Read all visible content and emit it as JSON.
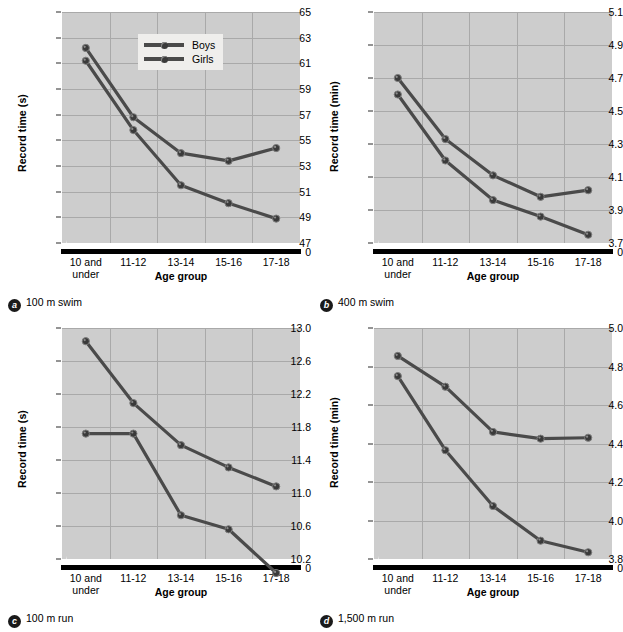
{
  "figure": {
    "legend": {
      "series": [
        "Boys",
        "Girls"
      ]
    },
    "xlabel": "Age group",
    "categories": [
      "10 and\nunder",
      "11-12",
      "13-14",
      "15-16",
      "17-18"
    ],
    "colors": {
      "plot_bg": "#cdcdcd",
      "grid": "#a9a9a9",
      "line": "#4a4a4a",
      "marker": "#3a3a3a",
      "legend_bg": "#efeeec"
    }
  },
  "panels": [
    {
      "key": "a",
      "badge": "a",
      "caption": "100 m swim",
      "ylabel": "Record time (s)"
    },
    {
      "key": "b",
      "badge": "b",
      "caption": "400 m swim",
      "ylabel": "Record time (min)"
    },
    {
      "key": "c",
      "badge": "c",
      "caption": "100 m run",
      "ylabel": "Record time (s)"
    },
    {
      "key": "d",
      "badge": "d",
      "caption": "1,500 m run",
      "ylabel": "Record time (min)"
    }
  ],
  "chart_data": [
    {
      "id": "a",
      "type": "line",
      "title": "100 m swim",
      "xlabel": "Age group",
      "ylabel": "Record time (s)",
      "categories": [
        "10 and under",
        "11-12",
        "13-14",
        "15-16",
        "17-18"
      ],
      "yticks": [
        47,
        49,
        51,
        53,
        55,
        57,
        59,
        61,
        63,
        65
      ],
      "ylim": [
        47,
        65
      ],
      "zero_break": true,
      "zero_label": "0",
      "grid": true,
      "legend_position": "top-center",
      "series": [
        {
          "name": "Boys",
          "values": [
            62.2,
            56.8,
            54.0,
            53.4,
            54.4
          ]
        },
        {
          "name": "Girls",
          "values": [
            61.2,
            55.8,
            51.5,
            50.1,
            48.9
          ]
        }
      ]
    },
    {
      "id": "b",
      "type": "line",
      "title": "400 m swim",
      "xlabel": "Age group",
      "ylabel": "Record time (min)",
      "categories": [
        "10 and under",
        "11-12",
        "13-14",
        "15-16",
        "17-18"
      ],
      "yticks": [
        3.7,
        3.9,
        4.1,
        4.3,
        4.5,
        4.7,
        4.9,
        5.1
      ],
      "ylim": [
        3.7,
        5.1
      ],
      "zero_break": true,
      "zero_label": "0",
      "grid": true,
      "legend_position": "none",
      "series": [
        {
          "name": "Boys",
          "values": [
            4.7,
            4.33,
            4.11,
            3.98,
            4.02
          ]
        },
        {
          "name": "Girls",
          "values": [
            4.6,
            4.2,
            3.96,
            3.86,
            3.75
          ]
        }
      ]
    },
    {
      "id": "c",
      "type": "line",
      "title": "100 m run",
      "xlabel": "Age group",
      "ylabel": "Record time (s)",
      "categories": [
        "10 and under",
        "11-12",
        "13-14",
        "15-16",
        "17-18"
      ],
      "yticks": [
        10.2,
        10.6,
        11.0,
        11.4,
        11.8,
        12.2,
        12.6,
        13.0
      ],
      "ylim": [
        10.2,
        13.0
      ],
      "zero_break": true,
      "zero_label": "0",
      "grid": true,
      "legend_position": "none",
      "series": [
        {
          "name": "Boys",
          "values": [
            11.72,
            11.72,
            10.73,
            10.56,
            10.03
          ]
        },
        {
          "name": "Girls",
          "values": [
            12.84,
            12.09,
            11.58,
            11.31,
            11.08
          ]
        }
      ]
    },
    {
      "id": "d",
      "type": "line",
      "title": "1,500 m run",
      "xlabel": "Age group",
      "ylabel": "Record time (min)",
      "categories": [
        "10 and under",
        "11-12",
        "13-14",
        "15-16",
        "17-18"
      ],
      "yticks": [
        3.8,
        4.0,
        4.2,
        4.4,
        4.6,
        4.8,
        5.0
      ],
      "ylim": [
        3.8,
        5.0
      ],
      "zero_break": true,
      "zero_label": "0",
      "grid": true,
      "legend_position": "none",
      "series": [
        {
          "name": "Boys",
          "values": [
            4.75,
            4.365,
            4.075,
            3.895,
            3.835
          ]
        },
        {
          "name": "Girls",
          "values": [
            4.855,
            4.695,
            4.46,
            4.425,
            4.43
          ]
        }
      ]
    }
  ]
}
